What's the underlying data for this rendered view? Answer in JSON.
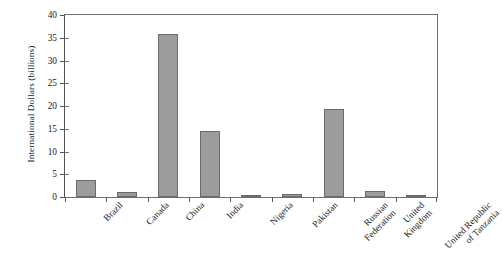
{
  "chart_data": {
    "type": "bar",
    "title": "",
    "subtitle": "",
    "xlabel": "",
    "ylabel": "International Dollars (billions)",
    "categories": [
      "Brazil",
      "Canada",
      "China",
      "India",
      "Nigeria",
      "Pakistan",
      "Russian\nFederation",
      "United\nKingdom",
      "United Republic\nof Tanzania"
    ],
    "category_lines": [
      [
        "Brazil"
      ],
      [
        "Canada"
      ],
      [
        "China"
      ],
      [
        "India"
      ],
      [
        "Nigeria"
      ],
      [
        "Pakistan"
      ],
      [
        "Russian",
        "Federation"
      ],
      [
        "United",
        "Kingdom"
      ],
      [
        "United Republic",
        "of Tanzania"
      ]
    ],
    "values": [
      3.7,
      1.1,
      35.9,
      14.4,
      0.3,
      0.7,
      19.3,
      1.4,
      0.3
    ],
    "ylim": [
      0,
      40
    ],
    "ytick_labels": [
      "0",
      "5",
      "10",
      "15",
      "20",
      "25",
      "30",
      "35",
      "40"
    ],
    "ytick_values": [
      0,
      5,
      10,
      15,
      20,
      25,
      30,
      35,
      40
    ],
    "grid": false,
    "legend": null,
    "legend_position": "none",
    "bar_fill_color": "#9c9c9c",
    "bar_edge_color": "#6a6a6a",
    "axis_color": "#555555",
    "background_color": "#ffffff"
  }
}
